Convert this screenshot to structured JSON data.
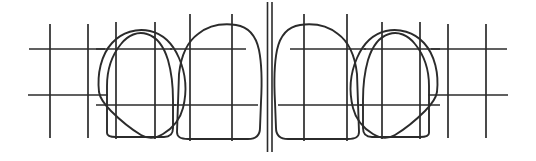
{
  "figure": {
    "background_color": "#ffffff",
    "ink_color": "#2b2b2b",
    "width": 536,
    "height": 161,
    "orientation": "labial-view",
    "symmetry": "bilateral-mirrored-about-midline"
  },
  "midline": {
    "name": "dental-midline",
    "style": "double-vertical-line",
    "x_left": 267.5,
    "x_right": 272.0,
    "y_top": 2,
    "y_bottom": 152,
    "stroke_width": 1.6
  },
  "quadrants": [
    {
      "name": "left-quadrant",
      "side": "left",
      "tooth_order_from_midline": [
        "central-incisor",
        "lateral-incisor",
        "canine"
      ]
    },
    {
      "name": "right-quadrant",
      "side": "right",
      "tooth_order_from_midline": [
        "central-incisor",
        "lateral-incisor",
        "canine"
      ]
    }
  ],
  "teeth": [
    {
      "id": "left-canine",
      "label": "Canine",
      "side": "left",
      "position_from_midline": 3,
      "shape": "pointed-oval-with-cusp",
      "outline_path": "M 99,92 C 97,74 101,55 112,43 C 122,32 137,28 150,31 C 163,34 173,44 179,58 C 186,74 187,92 183,108 C 180,120 173,128 163,134 C 155,139 148,139 141,135 C 131,129 120,120 111,111 C 104,104 100,98 99,92 Z",
      "cusp_tip": {
        "x": 143,
        "y": 137
      },
      "grid": {
        "verticals": [
          {
            "name": "mesial-vertical",
            "x": 50,
            "y_top": 24,
            "y_bottom": 138
          },
          {
            "name": "distal-vertical",
            "x": 88,
            "y_top": 24,
            "y_bottom": 138
          }
        ],
        "horizontals": [
          {
            "name": "incisal-third-line",
            "y": 49,
            "x_start": 29,
            "x_end": 105
          },
          {
            "name": "cervical-third-line",
            "y": 95,
            "x_start": 28,
            "x_end": 108
          }
        ]
      }
    },
    {
      "id": "left-lateral-incisor",
      "label": "Lateral incisor",
      "side": "left",
      "position_from_midline": 2,
      "shape": "dome-crown-flat-incisal-edge",
      "outline_path": "M 107,133 L 107,86 C 107,70 112,55 121,44 C 128,35 138,31 147,34 C 157,37 164,47 168,60 C 172,74 173,88 173,100 L 173,128 C 173,134 170,137 164,137 L 116,137 C 110,137 107,136 107,133 Z",
      "grid": {
        "verticals": [
          {
            "name": "mesial-vertical",
            "x": 116,
            "y_top": 22,
            "y_bottom": 139
          },
          {
            "name": "distal-vertical",
            "x": 155,
            "y_top": 22,
            "y_bottom": 139
          }
        ],
        "horizontals": [
          {
            "name": "incisal-third-line",
            "y": 49,
            "x_start": 96,
            "x_end": 172
          },
          {
            "name": "cervical-third-line",
            "y": 105,
            "x_start": 96,
            "x_end": 176
          }
        ]
      }
    },
    {
      "id": "left-central-incisor",
      "label": "Central incisor",
      "side": "left",
      "position_from_midline": 1,
      "shape": "broad-rectangular-crown",
      "outline_path": "M 177,132 L 179,74 C 181,56 187,42 198,34 C 208,26 222,23 236,25 C 249,27 256,36 259,50 C 262,65 262,84 261,102 L 260,128 C 260,136 256,139 248,139 L 188,139 C 180,139 177,137 177,132 Z",
      "grid": {
        "verticals": [
          {
            "name": "mesial-vertical",
            "x": 190,
            "y_top": 14,
            "y_bottom": 141
          },
          {
            "name": "distal-vertical",
            "x": 232,
            "y_top": 14,
            "y_bottom": 141
          }
        ],
        "horizontals": [
          {
            "name": "incisal-third-line",
            "y": 49,
            "x_start": 170,
            "x_end": 246
          },
          {
            "name": "cervical-third-line",
            "y": 105,
            "x_start": 172,
            "x_end": 258
          }
        ]
      }
    },
    {
      "id": "right-central-incisor",
      "label": "Central incisor",
      "side": "right",
      "position_from_midline": 1,
      "shape": "broad-rectangular-crown",
      "outline_path": "M 359,132 L 357,74 C 355,56 349,42 338,34 C 328,26 314,23 300,25 C 287,27 280,36 277,50 C 274,65 274,84 275,102 L 276,128 C 276,136 280,139 288,139 L 348,139 C 356,139 359,137 359,132 Z",
      "grid": {
        "verticals": [
          {
            "name": "mesial-vertical",
            "x": 304,
            "y_top": 14,
            "y_bottom": 141
          },
          {
            "name": "distal-vertical",
            "x": 347,
            "y_top": 14,
            "y_bottom": 141
          }
        ],
        "horizontals": [
          {
            "name": "incisal-third-line",
            "y": 49,
            "x_start": 290,
            "x_end": 366
          },
          {
            "name": "cervical-third-line",
            "y": 105,
            "x_start": 278,
            "x_end": 364
          }
        ]
      }
    },
    {
      "id": "right-lateral-incisor",
      "label": "Lateral incisor",
      "side": "right",
      "position_from_midline": 2,
      "shape": "dome-crown-flat-incisal-edge",
      "outline_path": "M 429,133 L 429,86 C 429,70 424,55 415,44 C 408,35 398,31 389,34 C 379,37 372,47 368,60 C 364,74 363,88 363,100 L 363,128 C 363,134 366,137 372,137 L 420,137 C 426,137 429,136 429,133 Z",
      "grid": {
        "verticals": [
          {
            "name": "mesial-vertical",
            "x": 382,
            "y_top": 22,
            "y_bottom": 139
          },
          {
            "name": "distal-vertical",
            "x": 420,
            "y_top": 22,
            "y_bottom": 139
          }
        ],
        "horizontals": [
          {
            "name": "incisal-third-line",
            "y": 49,
            "x_start": 364,
            "x_end": 440
          },
          {
            "name": "cervical-third-line",
            "y": 105,
            "x_start": 360,
            "x_end": 440
          }
        ]
      }
    },
    {
      "id": "right-canine",
      "label": "Canine",
      "side": "right",
      "position_from_midline": 3,
      "shape": "pointed-oval-with-cusp",
      "outline_path": "M 437,92 C 439,74 435,55 424,43 C 414,32 399,28 386,31 C 373,34 363,44 357,58 C 350,74 349,92 353,108 C 356,120 363,128 373,134 C 381,139 388,139 395,135 C 405,129 416,120 425,111 C 432,104 436,98 437,92 Z",
      "cusp_tip": {
        "x": 393,
        "y": 137
      },
      "grid": {
        "verticals": [
          {
            "name": "mesial-vertical",
            "x": 448,
            "y_top": 24,
            "y_bottom": 138
          },
          {
            "name": "distal-vertical",
            "x": 486,
            "y_top": 24,
            "y_bottom": 138
          }
        ],
        "horizontals": [
          {
            "name": "incisal-third-line",
            "y": 49,
            "x_start": 431,
            "x_end": 507
          },
          {
            "name": "cervical-third-line",
            "y": 95,
            "x_start": 428,
            "x_end": 508
          }
        ]
      }
    }
  ]
}
